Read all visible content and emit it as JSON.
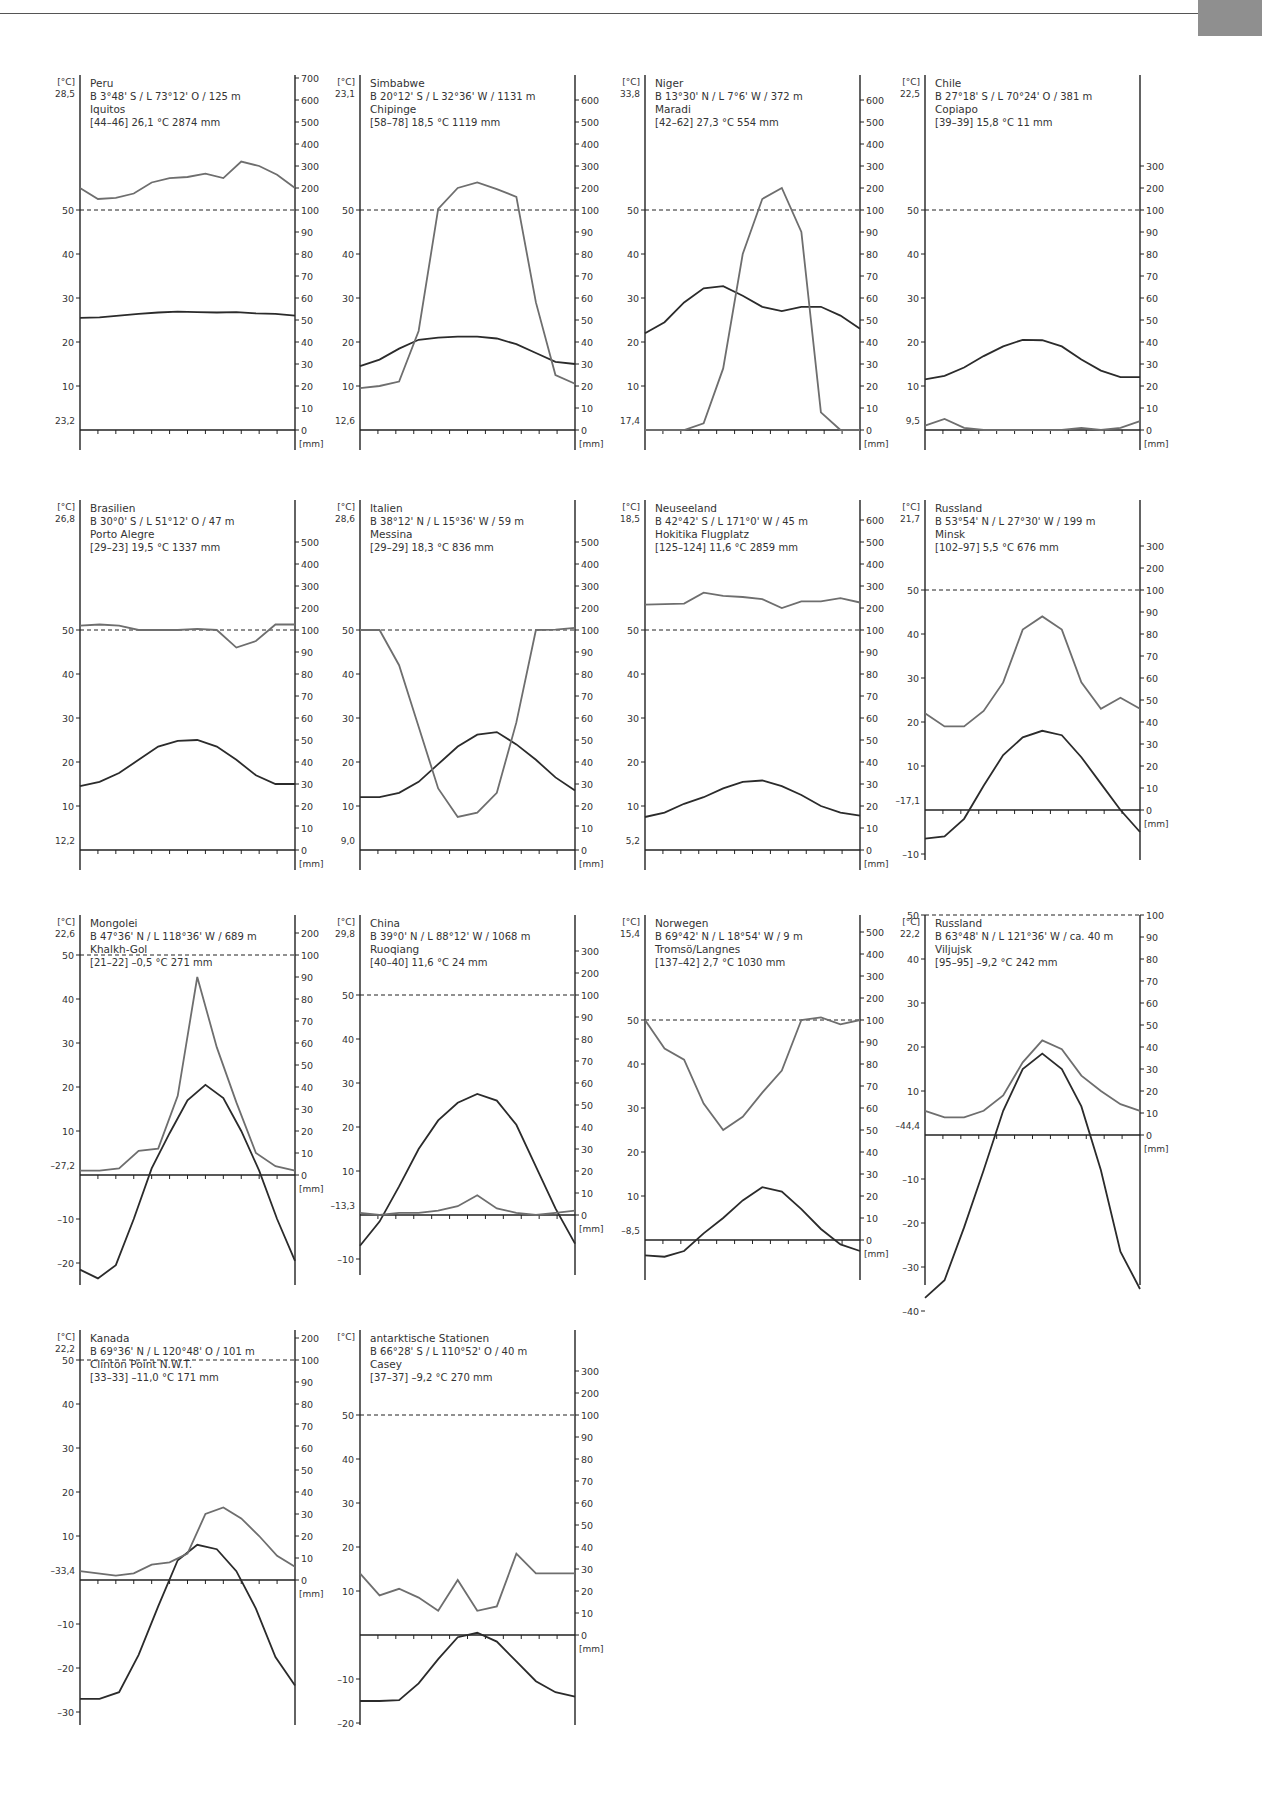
{
  "page": {
    "decoration": {
      "corner_tab_color": "#8f8f8f",
      "rule_color": "#555555"
    }
  },
  "labels": {
    "temp_unit": "[°C]",
    "precip_unit": "[mm]"
  },
  "colors": {
    "temperature": "#2b2b2b",
    "precipitation": "#6e6e6e",
    "axis": "#222222"
  },
  "chart_data": [
    {
      "type": "line",
      "country": "Peru",
      "coords": "B 3°48' S / L 73°12' O / 125 m",
      "station": "Iquitos",
      "summary": "[44–46]  26,1 °C  2874 mm",
      "max_label": "28,5",
      "min_label": "23,2",
      "temp_ticks": [
        10,
        20,
        30,
        40,
        50
      ],
      "temp_range": [
        0,
        50
      ],
      "precip_ticks": [
        0,
        10,
        20,
        30,
        40,
        50,
        60,
        70,
        80,
        90,
        100,
        200,
        300,
        400,
        500,
        600,
        700
      ],
      "temperature": [
        25.5,
        25.6,
        26.0,
        26.4,
        26.7,
        26.9,
        26.8,
        26.7,
        26.8,
        26.5,
        26.4,
        26.0
      ],
      "precipitation": [
        200,
        150,
        155,
        175,
        225,
        245,
        250,
        265,
        245,
        320,
        300,
        260,
        200
      ]
    },
    {
      "type": "line",
      "country": "Simbabwe",
      "coords": "B 20°12' S / L 32°36' W / 1131 m",
      "station": "Chipinge",
      "summary": "[58–78]  18,5 °C  1119 mm",
      "max_label": "23,1",
      "min_label": "12,6",
      "temp_ticks": [
        10,
        20,
        30,
        40,
        50
      ],
      "temp_range": [
        0,
        50
      ],
      "precip_ticks": [
        0,
        10,
        20,
        30,
        40,
        50,
        60,
        70,
        80,
        90,
        100,
        200,
        300,
        400,
        500,
        600
      ],
      "temperature": [
        14.5,
        16.0,
        18.5,
        20.5,
        21.0,
        21.2,
        21.2,
        20.8,
        19.5,
        17.5,
        15.5,
        15.0
      ],
      "precipitation": [
        19,
        20,
        22,
        45,
        105,
        200,
        225,
        195,
        160,
        58,
        25,
        21
      ]
    },
    {
      "type": "line",
      "country": "Niger",
      "coords": "B 13°30' N / L 7°6' W / 372 m",
      "station": "Maradi",
      "summary": "[42–62]  27,3 °C  554 mm",
      "max_label": "33,8",
      "min_label": "17,4",
      "temp_ticks": [
        10,
        20,
        30,
        40,
        50
      ],
      "temp_range": [
        0,
        50
      ],
      "precip_ticks": [
        0,
        10,
        20,
        30,
        40,
        50,
        60,
        70,
        80,
        90,
        100,
        200,
        300,
        400,
        500,
        600
      ],
      "temperature": [
        22.0,
        24.5,
        29.0,
        32.2,
        32.7,
        30.5,
        28.0,
        27.0,
        28.0,
        28.0,
        26.0,
        23.0
      ],
      "precipitation": [
        0,
        0,
        0,
        3,
        28,
        80,
        150,
        200,
        90,
        8,
        0,
        0
      ]
    },
    {
      "type": "line",
      "country": "Chile",
      "coords": "B 27°18' S / L 70°24' O / 381 m",
      "station": "Copiapo",
      "summary": "[39–39]  15,8 °C  11 mm",
      "max_label": "22,5",
      "min_label": "9,5",
      "temp_ticks": [
        10,
        20,
        30,
        40,
        50
      ],
      "temp_range": [
        0,
        50
      ],
      "precip_ticks": [
        0,
        10,
        20,
        30,
        40,
        50,
        60,
        70,
        80,
        90,
        100,
        200,
        300
      ],
      "temperature": [
        11.5,
        12.3,
        14.2,
        16.8,
        19.0,
        20.5,
        20.4,
        19.0,
        16.0,
        13.5,
        12.0,
        12.0
      ],
      "precipitation": [
        2,
        5,
        1,
        0,
        0,
        0,
        0,
        0,
        1,
        0,
        1,
        4
      ]
    },
    {
      "type": "line",
      "country": "Brasilien",
      "coords": "B 30°0' S / L 51°12' O / 47 m",
      "station": "Porto Alegre",
      "summary": "[29–23]  19,5 °C  1337 mm",
      "max_label": "26,8",
      "min_label": "12,2",
      "temp_ticks": [
        10,
        20,
        30,
        40,
        50
      ],
      "temp_range": [
        0,
        50
      ],
      "precip_ticks": [
        0,
        10,
        20,
        30,
        40,
        50,
        60,
        70,
        80,
        90,
        100,
        200,
        300,
        400,
        500
      ],
      "temperature": [
        14.5,
        15.5,
        17.5,
        20.5,
        23.5,
        24.8,
        25.0,
        23.5,
        20.5,
        17.0,
        15.0,
        15.0
      ],
      "precipitation": [
        120,
        125,
        120,
        100,
        100,
        100,
        105,
        100,
        92,
        95,
        125,
        125
      ]
    },
    {
      "type": "line",
      "country": "Italien",
      "coords": "B 38°12' N / L 15°36' W / 59 m",
      "station": "Messina",
      "summary": "[29–29]  18,3 °C  836 mm",
      "max_label": "28,6",
      "min_label": "9,0",
      "temp_ticks": [
        10,
        20,
        30,
        40,
        50
      ],
      "temp_range": [
        0,
        50
      ],
      "precip_ticks": [
        0,
        10,
        20,
        30,
        40,
        50,
        60,
        70,
        80,
        90,
        100,
        200,
        300,
        400,
        500
      ],
      "temperature": [
        12.0,
        12.0,
        13.0,
        15.5,
        19.5,
        23.5,
        26.2,
        26.8,
        24.0,
        20.5,
        16.5,
        13.5
      ],
      "precipitation": [
        100,
        100,
        84,
        56,
        28,
        15,
        17,
        26,
        58,
        100,
        102,
        110
      ]
    },
    {
      "type": "line",
      "country": "Neuseeland",
      "coords": "B 42°42' S / L 171°0' W / 45 m",
      "station": "Hokitika Flugplatz",
      "summary": "[125–124]  11,6 °C  2859 mm",
      "max_label": "18,5",
      "min_label": "5,2",
      "temp_ticks": [
        10,
        20,
        30,
        40,
        50
      ],
      "temp_range": [
        0,
        50
      ],
      "precip_ticks": [
        0,
        10,
        20,
        30,
        40,
        50,
        60,
        70,
        80,
        90,
        100,
        200,
        300,
        400,
        500,
        600
      ],
      "temperature": [
        7.5,
        8.5,
        10.5,
        12.0,
        14.0,
        15.5,
        15.8,
        14.5,
        12.5,
        10.0,
        8.5,
        7.8
      ],
      "precipitation": [
        215,
        218,
        220,
        270,
        255,
        250,
        240,
        200,
        230,
        230,
        245,
        225
      ]
    },
    {
      "type": "line",
      "country": "Russland",
      "coords": "B 53°54' N / L 27°30' W / 199 m",
      "station": "Minsk",
      "summary": "[102–97]  5,5 °C  676 mm",
      "max_label": "21,7",
      "min_label": "–17,1",
      "temp_ticks": [
        -10,
        10,
        20,
        30,
        40,
        50
      ],
      "temp_range": [
        -10,
        50
      ],
      "precip_ticks": [
        0,
        10,
        20,
        30,
        40,
        50,
        60,
        70,
        80,
        90,
        100,
        200,
        300
      ],
      "temperature": [
        -6.5,
        -6.0,
        -2.0,
        5.5,
        12.5,
        16.5,
        18.0,
        17.0,
        12.0,
        6.0,
        0.0,
        -5.0
      ],
      "precipitation": [
        44,
        38,
        38,
        45,
        58,
        82,
        88,
        82,
        58,
        46,
        51,
        46
      ]
    },
    {
      "type": "line",
      "country": "Mongolei",
      "coords": "B 47°36' N / L 118°36' W / 689 m",
      "station": "Khalkh-Gol",
      "summary": "[21–22]  –0,5 °C  271 mm",
      "max_label": "22,6",
      "min_label": "–27,2",
      "temp_ticks": [
        -20,
        -10,
        10,
        20,
        30,
        40,
        50
      ],
      "temp_range": [
        -24,
        50
      ],
      "precip_ticks": [
        0,
        10,
        20,
        30,
        40,
        50,
        60,
        70,
        80,
        90,
        100,
        200,
        300,
        400
      ],
      "temperature": [
        -21.5,
        -23.5,
        -20.5,
        -10.0,
        1.5,
        9.5,
        17.0,
        20.5,
        17.5,
        10.0,
        1.0,
        -10.0,
        -19.5
      ],
      "precipitation": [
        2,
        2,
        3,
        11,
        12,
        36,
        90,
        58,
        33,
        10,
        4,
        2
      ]
    },
    {
      "type": "line",
      "country": "China",
      "coords": "B 39°0' N / L 88°12' W / 1068 m",
      "station": "Ruoqiang",
      "summary": "[40–40]  11,6 °C  24 mm",
      "max_label": "29,8",
      "min_label": "–13,3",
      "temp_ticks": [
        -10,
        10,
        20,
        30,
        40,
        50
      ],
      "temp_range": [
        -10,
        50
      ],
      "precip_ticks": [
        0,
        10,
        20,
        30,
        40,
        50,
        60,
        70,
        80,
        90,
        100,
        200,
        300
      ],
      "temperature": [
        -7.0,
        -1.5,
        6.5,
        15.0,
        21.5,
        25.5,
        27.5,
        26.0,
        20.5,
        11.0,
        1.5,
        -6.5
      ],
      "precipitation": [
        1,
        0,
        1,
        1,
        2,
        4,
        9,
        3,
        1,
        0,
        1,
        2
      ]
    },
    {
      "type": "line",
      "country": "Norwegen",
      "coords": "B 69°42' N / L 18°54' W / 9 m",
      "station": "Tromsö/Langnes",
      "summary": "[137–42]  2,7 °C  1030 mm",
      "max_label": "15,4",
      "min_label": "–8,5",
      "temp_ticks": [
        10,
        20,
        30,
        40,
        50
      ],
      "temp_range": [
        -4,
        50
      ],
      "precip_ticks": [
        0,
        10,
        20,
        30,
        40,
        50,
        60,
        70,
        80,
        90,
        100,
        200,
        300,
        400,
        500
      ],
      "temperature": [
        -3.5,
        -3.8,
        -2.5,
        1.5,
        5.0,
        9.0,
        12.0,
        11.0,
        7.0,
        2.5,
        -1.0,
        -2.5
      ],
      "precipitation": [
        100,
        87,
        82,
        62,
        50,
        56,
        67,
        77,
        100,
        112,
        98,
        100
      ]
    },
    {
      "type": "line",
      "country": "Russland",
      "coords": "B 63°48' N / L 121°36' W / ca. 40 m",
      "station": "Viljujsk",
      "summary": "[95–95]  –9,2 °C  242 mm",
      "max_label": "22,2",
      "min_label": "–44,4",
      "temp_ticks": [
        -40,
        -30,
        -20,
        -10,
        10,
        20,
        30,
        40,
        50
      ],
      "temp_range": [
        -40,
        50
      ],
      "precip_ticks": [
        0,
        10,
        20,
        30,
        40,
        50,
        60,
        70,
        80,
        90,
        100,
        200,
        300
      ],
      "temperature": [
        -37.0,
        -33.0,
        -21.0,
        -8.0,
        5.5,
        15.0,
        18.5,
        15.0,
        6.5,
        -8.0,
        -26.5,
        -35.0
      ],
      "precipitation": [
        11,
        8,
        8,
        11,
        18,
        33,
        43,
        39,
        27,
        20,
        14,
        11
      ]
    },
    {
      "type": "line",
      "country": "Kanada",
      "coords": "B 69°36' N / L 120°48' O / 101 m",
      "station": "Clinton Point N.W.T.",
      "summary": "[33–33]  –11,0 °C  171 mm",
      "max_label": "22,2",
      "min_label": "–33,4",
      "temp_ticks": [
        -30,
        -20,
        -10,
        10,
        20,
        30,
        40,
        50
      ],
      "temp_range": [
        -30,
        50
      ],
      "precip_ticks": [
        0,
        10,
        20,
        30,
        40,
        50,
        60,
        70,
        80,
        90,
        100,
        200,
        300
      ],
      "temperature": [
        -27.0,
        -27.0,
        -25.5,
        -17.0,
        -6.0,
        4.5,
        8.0,
        7.0,
        2.0,
        -6.5,
        -17.5,
        -24.0
      ],
      "precipitation": [
        4,
        3,
        2,
        3,
        7,
        8,
        12,
        30,
        33,
        28,
        20,
        11,
        6
      ]
    },
    {
      "type": "line",
      "country": "antarktische Stationen",
      "coords": "B 66°28' S / L 110°52' O / 40 m",
      "station": "Casey",
      "summary": "[37–37]  –9,2 °C  270 mm",
      "max_label": "",
      "min_label": "",
      "temp_ticks": [
        -20,
        -10,
        10,
        20,
        30,
        40,
        50
      ],
      "temp_range": [
        -24,
        50
      ],
      "precip_ticks": [
        0,
        10,
        20,
        30,
        40,
        50,
        60,
        70,
        80,
        90,
        100,
        200,
        300
      ],
      "temperature": [
        -15.0,
        -15.0,
        -14.8,
        -11.0,
        -5.5,
        -0.5,
        0.5,
        -1.5,
        -6.0,
        -10.5,
        -13.0,
        -14.0
      ],
      "precipitation": [
        28,
        18,
        21,
        17,
        11,
        25,
        11,
        13,
        37,
        28,
        28,
        28
      ]
    }
  ]
}
